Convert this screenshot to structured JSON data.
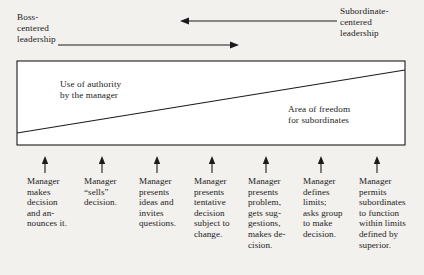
{
  "diagram": {
    "background_color": "#f3f1ee",
    "ink_color": "#1b1b1b",
    "ends": {
      "left_label": "Boss-\ncentered\nleadership",
      "right_label": "Subordinate-\ncentered\nleadership"
    },
    "arrows": {
      "top": {
        "direction": "left",
        "from_x": 337,
        "to_x": 182,
        "y": 21
      },
      "bottom": {
        "direction": "right",
        "from_x": 67,
        "to_x": 237,
        "y": 45
      }
    },
    "box": {
      "x": 17,
      "y": 61,
      "width": 388,
      "height": 84,
      "diagonal": {
        "x1": 17,
        "y1": 133,
        "x2": 405,
        "y2": 70
      },
      "upper_region_label": "Use of authority\nby the manager",
      "lower_region_label": "Area of freedom\nfor subordinates"
    },
    "axis": {
      "tick_count": 7,
      "tick_positions": [
        45,
        102,
        157,
        212,
        266,
        321,
        377
      ],
      "tick_direction": "up"
    },
    "steps": [
      {
        "index": 1,
        "x": 27,
        "width": 52,
        "text": "Manager\nmakes\ndecision\nand an-\nnounces it."
      },
      {
        "index": 2,
        "x": 84,
        "width": 52,
        "text": "Manager\n“sells”\ndecision."
      },
      {
        "index": 3,
        "x": 139,
        "width": 56,
        "text": "Manager\npresents\nideas and\ninvites\nquestions."
      },
      {
        "index": 4,
        "x": 194,
        "width": 54,
        "text": "Manager\npresents\ntentative\ndecision\nsubject to\nchange."
      },
      {
        "index": 5,
        "x": 248,
        "width": 54,
        "text": "Manager\npresents\nproblem,\ngets sug-\ngestions,\nmakes de-\ncision."
      },
      {
        "index": 6,
        "x": 303,
        "width": 56,
        "text": "Manager\ndefines\nlimits;\nasks group\nto make\ndecision."
      },
      {
        "index": 7,
        "x": 359,
        "width": 62,
        "text": "Manager\npermits\nsubordinates\nto function\nwithin limits\ndefined by\nsuperior."
      }
    ]
  }
}
